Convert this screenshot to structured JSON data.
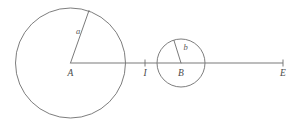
{
  "figure": {
    "canvas": {
      "width": 298,
      "height": 123,
      "background": "#ffffff"
    },
    "colors": {
      "circle_stroke": "#6e6e6e",
      "axis_stroke": "#7a7a7a",
      "radius_stroke": "#6b6b6b",
      "label_fill": "#4a4a4a"
    },
    "circles": [
      {
        "id": "circle-A",
        "center_label": "A",
        "cx": 70.5,
        "cy": 63,
        "r": 55,
        "radius_label": "a"
      },
      {
        "id": "circle-B",
        "center_label": "B",
        "cx": 181,
        "cy": 63,
        "r": 24,
        "radius_label": "b"
      }
    ],
    "axis": {
      "id": "baseline",
      "x1": 70.5,
      "y1": 63,
      "x2": 283,
      "y2": 63
    },
    "radii": [
      {
        "id": "radius-a",
        "label": "a",
        "x1": 70.5,
        "y1": 63,
        "x2": 89,
        "y2": 10.5,
        "label_x": 78,
        "label_y": 32
      },
      {
        "id": "radius-b",
        "label": "b",
        "x1": 181,
        "y1": 63,
        "x2": 174,
        "y2": 40.5,
        "label_x": 185.5,
        "label_y": 48
      }
    ],
    "ticks": [
      {
        "id": "tick-I",
        "x": 145,
        "y": 63,
        "half_height": 3.5
      },
      {
        "id": "tick-E",
        "x": 283,
        "y": 63,
        "half_height": 3.5
      }
    ],
    "point_labels": [
      {
        "id": "label-A",
        "text": "A",
        "x": 70.5,
        "y": 76
      },
      {
        "id": "label-I",
        "text": "I",
        "x": 145,
        "y": 76
      },
      {
        "id": "label-B",
        "text": "B",
        "x": 181,
        "y": 76
      },
      {
        "id": "label-E",
        "text": "E",
        "x": 283,
        "y": 76
      }
    ]
  }
}
